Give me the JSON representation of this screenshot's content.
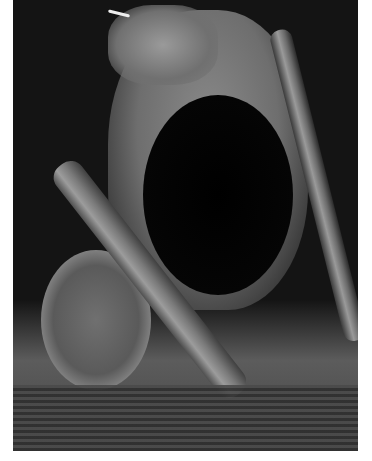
{
  "image": {
    "description": "Grayscale dark-field microscopy image of an organism with a large dark oval structure, a diagonal rod, a granular disc at lower left and striated tissue at bottom",
    "colors": {
      "background": "#141414",
      "border": "#ffffff",
      "highlight": "#9a9a9a",
      "dark_oval": "#000000"
    }
  }
}
